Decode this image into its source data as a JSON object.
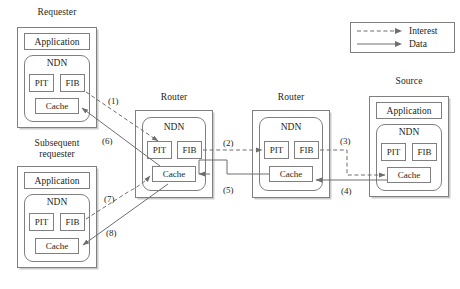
{
  "diagram": {
    "stroke_color": "#6e6e6e",
    "text_color": "#231f20"
  },
  "legend": {
    "items": [
      {
        "label": "Interest",
        "style": "dashed",
        "icon": "dashed-arrow-icon"
      },
      {
        "label": "Data",
        "style": "solid",
        "icon": "solid-arrow-icon"
      }
    ]
  },
  "nodes": [
    {
      "id": "requester",
      "title": "Requester",
      "application": "Application",
      "ndn_label": "NDN",
      "cells": {
        "pit": "PIT",
        "fib": "FIB",
        "cache": "Cache"
      }
    },
    {
      "id": "subsequent-requester",
      "title": "Subsequent\nrequester",
      "application": "Application",
      "ndn_label": "NDN",
      "cells": {
        "pit": "PIT",
        "fib": "FIB",
        "cache": "Cache"
      }
    },
    {
      "id": "router-1",
      "title": "Router",
      "application": null,
      "ndn_label": "NDN",
      "cells": {
        "pit": "PIT",
        "fib": "FIB",
        "cache": "Cache"
      }
    },
    {
      "id": "router-2",
      "title": "Router",
      "application": null,
      "ndn_label": "NDN",
      "cells": {
        "pit": "PIT",
        "fib": "FIB",
        "cache": "Cache"
      }
    },
    {
      "id": "source",
      "title": "Source",
      "application": "Application",
      "ndn_label": "NDN",
      "cells": {
        "pit": "PIT",
        "fib": "FIB",
        "cache": "Cache"
      }
    }
  ],
  "flows": [
    {
      "id": 1,
      "label": "(1)",
      "type": "interest",
      "from": "requester.fib",
      "to": "router-1.pit"
    },
    {
      "id": 2,
      "label": "(2)",
      "type": "interest",
      "from": "router-1.fib",
      "to": "router-2.pit"
    },
    {
      "id": 3,
      "label": "(3)",
      "type": "interest",
      "from": "router-2.fib",
      "to": "source.cache"
    },
    {
      "id": 4,
      "label": "(4)",
      "type": "data",
      "from": "source.cache",
      "to": "router-2.cache"
    },
    {
      "id": 5,
      "label": "(5)",
      "type": "data",
      "from": "router-2.cache",
      "to": "router-1.cache"
    },
    {
      "id": 6,
      "label": "(6)",
      "type": "data",
      "from": "router-1.cache",
      "to": "requester.cache"
    },
    {
      "id": 7,
      "label": "(7)",
      "type": "interest",
      "from": "subsequent-requester.fib",
      "to": "router-1.cache"
    },
    {
      "id": 8,
      "label": "(8)",
      "type": "data",
      "from": "router-1.cache",
      "to": "subsequent-requester.cache"
    }
  ]
}
